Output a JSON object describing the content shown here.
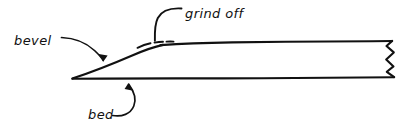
{
  "diagram": {
    "style": "hand-drawn line sketch, black ink on white",
    "background_color": "#ffffff",
    "ink_color": "#111111",
    "labels": [
      {
        "id": "bevel",
        "text": "bevel",
        "x": 14,
        "y": 45,
        "leader": "curved arrow sweeping down-right to the sloped bevel face",
        "points_to": "bevel-face"
      },
      {
        "id": "grind_off",
        "text": "grind off",
        "x": 185,
        "y": 18,
        "leader": "hooked leader dropping straight down to the dashed material zone",
        "points_to": "grind-off-dashes"
      },
      {
        "id": "bed",
        "text": "bed",
        "x": 88,
        "y": 119,
        "leader": "J-shaped curve rising to an arrowhead on the lower flat face",
        "points_to": "bed-line"
      }
    ],
    "geometry": {
      "tip": {
        "x": 72,
        "y": 79
      },
      "bed_line": {
        "x1": 72,
        "y1": 79,
        "x2": 395,
        "y2": 77
      },
      "top_line": {
        "x1": 160,
        "y1": 43,
        "x2": 393,
        "y2": 41
      },
      "bevel_face": "long tapered ramp from the tip up to the top face",
      "break_edge": "zigzag break line at the right side indicating the part continues"
    },
    "annotation_notes": {
      "grind_off_dashes": "short dashed strokes above the blade surface marking material to be removed",
      "break_line": "ragged vertical zigzag at right edge"
    }
  }
}
